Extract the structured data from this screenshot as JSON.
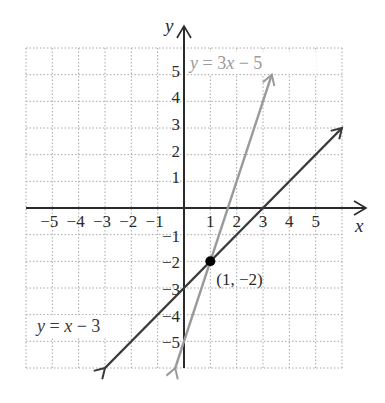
{
  "chart_data": {
    "type": "line",
    "title": "",
    "xlabel": "x",
    "ylabel": "y",
    "xlim": [
      -6,
      6
    ],
    "ylim": [
      -6,
      6
    ],
    "grid": true,
    "grid_style": "dotted",
    "x_ticks": [
      -5,
      -4,
      -3,
      -2,
      -1,
      1,
      2,
      3,
      4,
      5
    ],
    "y_ticks": [
      -5,
      -4,
      -3,
      -2,
      -1,
      1,
      2,
      3,
      4,
      5
    ],
    "x_tick_labels": [
      "−5",
      "−4",
      "−3",
      "−2",
      "−1",
      "1",
      "2",
      "3",
      "4",
      "5"
    ],
    "y_tick_labels": [
      "5",
      "4",
      "3",
      "2",
      "1",
      "−1",
      "−2",
      "−3",
      "−4",
      "−5"
    ],
    "series": [
      {
        "name": "y = x − 3",
        "label_parts": [
          "y",
          " = ",
          "x",
          " − 3"
        ],
        "color": "#3a3a3a",
        "slope": 1,
        "intercept": -3,
        "x": [
          -3,
          6
        ],
        "y": [
          -6,
          3
        ]
      },
      {
        "name": "y = 3x − 5",
        "label_parts": [
          "y",
          " = 3",
          "x",
          " − 5"
        ],
        "color": "#9a9a9a",
        "slope": 3,
        "intercept": -5,
        "x": [
          -0.333,
          3.333
        ],
        "y": [
          -6,
          5
        ]
      }
    ],
    "annotations": [
      {
        "type": "point",
        "x": 1,
        "y": -2,
        "label": "(1, −2)",
        "color": "#000000"
      }
    ]
  },
  "colors": {
    "axis": "#2a2a2a",
    "grid": "#a8a8a8",
    "line_dark": "#3a3a3a",
    "line_light": "#9a9a9a",
    "point": "#000000"
  }
}
